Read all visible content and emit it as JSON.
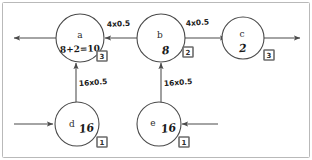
{
  "diagram": {
    "style": "hand-drawn pencil sketch on white paper",
    "ink_color": "#4a4a4a",
    "badge_color": "#6b6b6b",
    "nodes": [
      {
        "id": "a",
        "label": "a",
        "value": "8+2=10",
        "badge": "3",
        "row": "top"
      },
      {
        "id": "b",
        "label": "b",
        "value": "8",
        "badge": "2",
        "row": "top"
      },
      {
        "id": "c",
        "label": "c",
        "value": "2",
        "badge": "3",
        "row": "top"
      },
      {
        "id": "d",
        "label": "d",
        "value": "16",
        "badge": "1",
        "row": "bottom"
      },
      {
        "id": "e",
        "label": "e",
        "value": "16",
        "badge": "1",
        "row": "bottom"
      }
    ],
    "edges": [
      {
        "id": "b-to-a",
        "from": "b",
        "to": "a",
        "label": "4x0.5",
        "direction": "left"
      },
      {
        "id": "b-to-c",
        "from": "b",
        "to": "c",
        "label": "4x0.5",
        "direction": "right"
      },
      {
        "id": "d-to-a",
        "from": "d",
        "to": "a",
        "label": "16x0.5",
        "direction": "up"
      },
      {
        "id": "e-to-b",
        "from": "e",
        "to": "b",
        "label": "16x0.5",
        "direction": "up"
      },
      {
        "id": "a-out-left",
        "from": "a",
        "to": "",
        "label": "",
        "direction": "left"
      },
      {
        "id": "c-out-right",
        "from": "c",
        "to": "",
        "label": "",
        "direction": "right"
      },
      {
        "id": "in-to-d",
        "from": "",
        "to": "d",
        "label": "",
        "direction": "right"
      },
      {
        "id": "in-to-e",
        "from": "",
        "to": "e",
        "label": "",
        "direction": "left"
      }
    ]
  }
}
